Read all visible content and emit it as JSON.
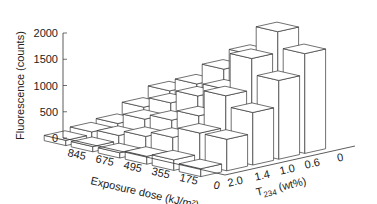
{
  "chart_data": {
    "type": "bar3d",
    "title": "",
    "zlabel": "Fluorescence (counts)",
    "xlabel": "Exposure dose (kJ/m²)",
    "ylabel_main": "T",
    "ylabel_sub": "234",
    "ylabel_tail": " (wt%)",
    "z_ticks": [
      "0",
      "500",
      "1000",
      "1500",
      "2000"
    ],
    "zlim": [
      0,
      2000
    ],
    "dose_categories": [
      "845",
      "675",
      "495",
      "355",
      "175",
      "0"
    ],
    "t234_categories": [
      "0",
      "0.6",
      "1.0",
      "1.4",
      "2.0"
    ],
    "series": [
      {
        "name": "T234 = 0",
        "values": [
          600,
          850,
          1250,
          1650,
          2200,
          1900
        ]
      },
      {
        "name": "T234 = 0.6",
        "values": [
          400,
          600,
          850,
          1100,
          1800,
          1500
        ]
      },
      {
        "name": "T234 = 1.0",
        "values": [
          200,
          400,
          500,
          700,
          1200,
          1000
        ]
      },
      {
        "name": "T234 = 1.4",
        "values": [
          150,
          200,
          300,
          400,
          600,
          600
        ]
      },
      {
        "name": "T234 = 2.0",
        "values": [
          100,
          100,
          100,
          150,
          200,
          150
        ]
      }
    ],
    "grid": false,
    "legend": "none"
  }
}
